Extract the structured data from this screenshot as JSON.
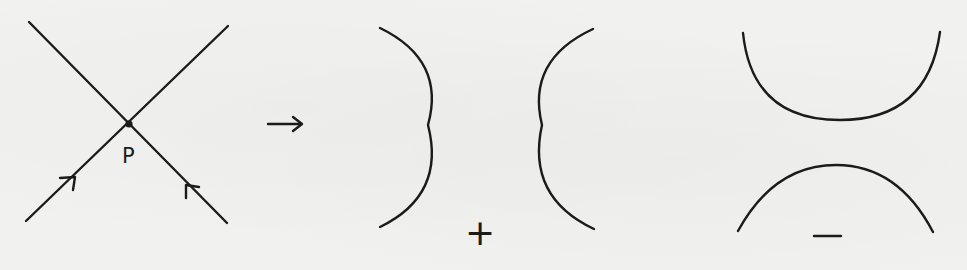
{
  "figure": {
    "colors": {
      "background": "#f1f1ef",
      "ink": "#1b1b1b"
    },
    "crossing": {
      "point_label": "P",
      "center": [
        129,
        124
      ],
      "line_a": {
        "from": [
          29,
          22
        ],
        "to": [
          227,
          223
        ],
        "arrow_direction": "toward-P",
        "arrow_at": [
          193,
          190
        ]
      },
      "line_b": {
        "from": [
          26,
          221
        ],
        "to": [
          228,
          26
        ],
        "arrow_direction": "toward-P",
        "arrow_at": [
          69,
          181
        ]
      }
    },
    "transition_arrow": {
      "symbol": "→",
      "from": [
        268,
        124
      ],
      "to": [
        302,
        124
      ]
    },
    "smoothings": [
      {
        "name": "positive-smoothing",
        "sign_label": "+",
        "orientation": "vertical",
        "arcs": [
          {
            "shape": ")",
            "top": [
              380,
              28
            ],
            "extreme": [
              428,
              125
            ],
            "bottom": [
              380,
              227
            ]
          },
          {
            "shape": "(",
            "top": [
              593,
              29
            ],
            "extreme": [
              542,
              125
            ],
            "bottom": [
              594,
              229
            ]
          }
        ],
        "label_position": [
          480,
          234
        ]
      },
      {
        "name": "negative-smoothing",
        "sign_label": "−",
        "orientation": "horizontal",
        "arcs": [
          {
            "shape": "U",
            "left": [
              743,
              33
            ],
            "extreme": [
              840,
              120
            ],
            "right": [
              940,
              32
            ]
          },
          {
            "shape": "∩",
            "left": [
              738,
              231
            ],
            "extreme": [
              836,
              165
            ],
            "right": [
              933,
              232
            ]
          }
        ],
        "label_position": [
          828,
          236
        ]
      }
    ]
  }
}
